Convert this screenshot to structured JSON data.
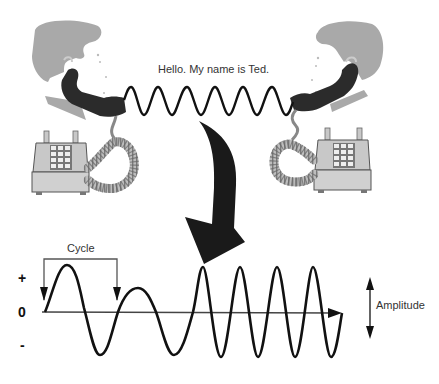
{
  "diagram": {
    "speech_text": "Hello. My name is Ted.",
    "labels": {
      "cycle": "Cycle",
      "amplitude": "Amplitude",
      "positive": "+",
      "zero": "0",
      "negative": "-"
    },
    "figures": {
      "left_person": "man-on-phone-facing-right",
      "right_person": "man-on-phone-facing-left",
      "left_telephone": "push-button-desk-telephone",
      "right_telephone": "push-button-desk-telephone",
      "connection": "wave-signal-between-handsets",
      "transition_arrow": "curved-down-arrow"
    },
    "waveform": {
      "description": "Sound wave with varying frequency and amplitude plotted about a zero axis",
      "segments": [
        {
          "type": "low-frequency",
          "cycles": 2
        },
        {
          "type": "high-frequency",
          "cycles": 4
        }
      ]
    },
    "colors": {
      "hair": "#a9a9a9",
      "handset": "#2b2b2b",
      "phone_body": "#c8c8c8",
      "wave": "#111111",
      "axis": "#444444"
    }
  }
}
